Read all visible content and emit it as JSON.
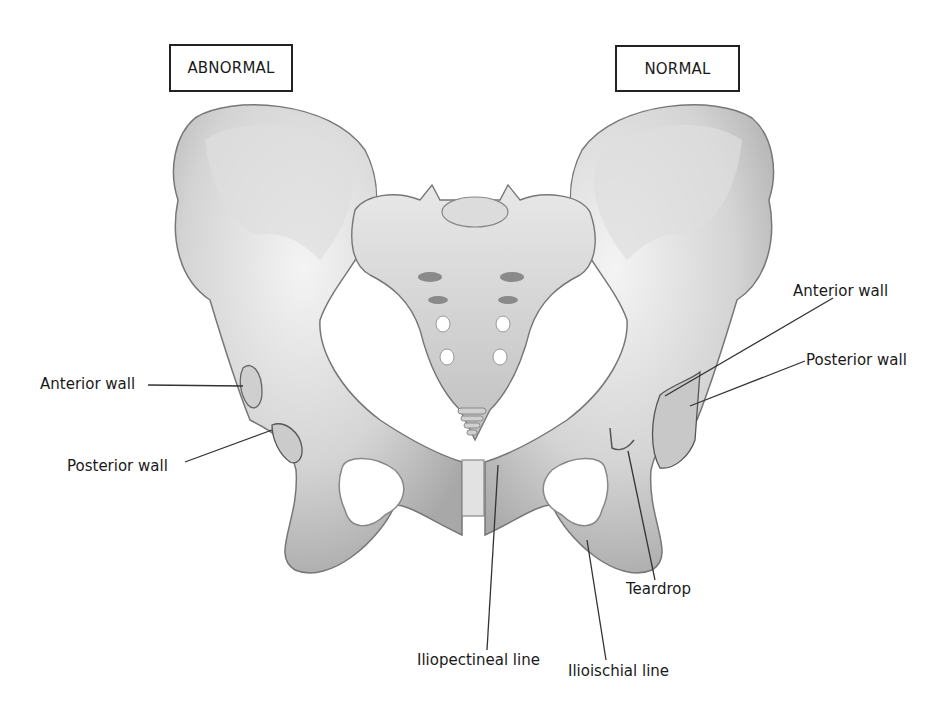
{
  "figure": {
    "side_labels": {
      "left": "ABNORMAL",
      "right": "NORMAL"
    },
    "annotations": {
      "left_anterior_wall": "Anterior wall",
      "left_posterior_wall": "Posterior wall",
      "right_anterior_wall": "Anterior wall",
      "right_posterior_wall": "Posterior wall",
      "teardrop": "Teardrop",
      "iliopectineal_line": "Iliopectineal line",
      "ilioischial_line": "Ilioischial line"
    },
    "colors": {
      "bone_light": "#e6e6e6",
      "bone_mid": "#c8c8c8",
      "bone_shadow": "#9a9a9a",
      "outline": "#6e6e6e",
      "leader_line": "#333333",
      "background": "#ffffff"
    }
  }
}
